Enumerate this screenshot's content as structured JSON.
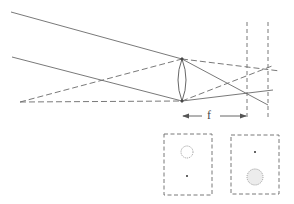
{
  "diagram": {
    "type": "optics-ray-diagram",
    "focal_label": "f",
    "colors": {
      "line": "#6a6a6a",
      "background": "#ffffff"
    },
    "lens": {
      "x": 182,
      "top": 59,
      "bottom": 101
    },
    "solid_rays": [
      {
        "x1": 11,
        "y1": 12,
        "x2": 182,
        "y2": 59
      },
      {
        "x1": 182,
        "y1": 59,
        "x2": 268,
        "y2": 105
      },
      {
        "x1": 12,
        "y1": 57,
        "x2": 182,
        "y2": 101
      },
      {
        "x1": 182,
        "y1": 101,
        "x2": 273,
        "y2": 90
      }
    ],
    "dashed_rays": [
      {
        "x1": 20,
        "y1": 102,
        "x2": 182,
        "y2": 59
      },
      {
        "x1": 182,
        "y1": 59,
        "x2": 280,
        "y2": 71
      },
      {
        "x1": 20,
        "y1": 102,
        "x2": 182,
        "y2": 101
      },
      {
        "x1": 182,
        "y1": 101,
        "x2": 272,
        "y2": 66
      }
    ],
    "planes": [
      {
        "name": "focal-plane",
        "x": 247,
        "y1": 22,
        "y2": 118
      },
      {
        "name": "image-plane",
        "x": 268,
        "y1": 22,
        "y2": 118
      }
    ],
    "focal_arrow": {
      "y": 116,
      "x_start": 182,
      "x_end": 247
    },
    "panels": [
      {
        "name": "left-panel",
        "x": 164,
        "y": 134,
        "w": 48,
        "h": 61,
        "blur": {
          "cx": 187,
          "cy": 152,
          "r": 6
        },
        "dot": {
          "cx": 187,
          "cy": 176
        }
      },
      {
        "name": "right-panel",
        "x": 231,
        "y": 135,
        "w": 48,
        "h": 59,
        "dot": {
          "cx": 255,
          "cy": 152
        },
        "blur": {
          "cx": 255,
          "cy": 177,
          "r": 8
        }
      }
    ]
  }
}
